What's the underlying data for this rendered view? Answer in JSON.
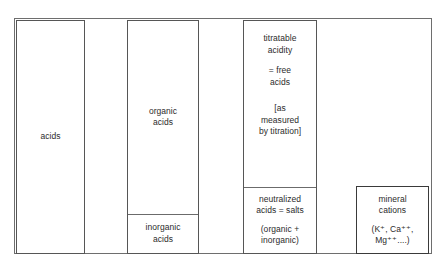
{
  "diagram": {
    "colors": {
      "outer_frame": "#6e6e6e",
      "box_border": "#565656",
      "divider": "#6b6b6b",
      "text": "#2b2b2b",
      "background": "#ffffff"
    },
    "columns": [
      {
        "name": "acids",
        "cells": [
          {
            "name": "acids",
            "lines": [
              "acids"
            ]
          }
        ]
      },
      {
        "name": "acids-split",
        "cells": [
          {
            "name": "organic-acids",
            "lines": [
              "organic\nacids"
            ]
          },
          {
            "name": "inorganic-acids",
            "lines": [
              "inorganic\nacids"
            ]
          }
        ]
      },
      {
        "name": "titratable-acidity",
        "cells": [
          {
            "name": "free-acids",
            "lines": [
              "titratable\nacidity",
              "= free\nacids",
              "[as\nmeasured\nby titration]"
            ]
          },
          {
            "name": "neutralized-acids",
            "lines": [
              "neutralized\nacids = salts",
              "(organic +\ninorganic)"
            ]
          }
        ]
      },
      {
        "name": "mineral-cations",
        "cells": [
          {
            "name": "mineral-cations",
            "lines": [
              "mineral\ncations",
              "(K⁺, Ca⁺⁺,\nMg⁺⁺....)"
            ]
          }
        ]
      }
    ]
  }
}
